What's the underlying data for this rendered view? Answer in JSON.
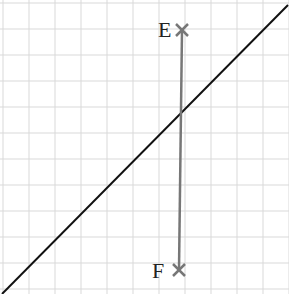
{
  "diagram": {
    "grid": {
      "spacing": 26,
      "origin_x": 3,
      "origin_y": 3,
      "color": "#d9d9d9"
    },
    "line": {
      "x1": 2,
      "y1": 294,
      "x2": 288,
      "y2": 5,
      "color": "#111111"
    },
    "segment": {
      "x1": 182,
      "y1": 30,
      "x2": 179,
      "y2": 270,
      "color": "#777777"
    },
    "points": [
      {
        "label": "E",
        "x": 182,
        "y": 30
      },
      {
        "label": "F",
        "x": 179,
        "y": 270
      }
    ]
  }
}
